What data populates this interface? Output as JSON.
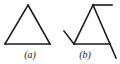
{
  "figure": {
    "background_color": "#ffffff",
    "stroke_color": "#1a1a1a",
    "stroke_width": 1.6,
    "panels": [
      {
        "id": "a",
        "label": "(a)",
        "caption_style": "italic-serif",
        "description": "closed equilateral-like triangle",
        "shape": "triangle-closed",
        "vertices": [
          {
            "name": "apex",
            "x": 28,
            "y": 5
          },
          {
            "name": "bottom-left",
            "x": 5,
            "y": 44
          },
          {
            "name": "bottom-right",
            "x": 50,
            "y": 44
          }
        ],
        "overshoots": []
      },
      {
        "id": "b",
        "label": "(b)",
        "caption_style": "italic-serif",
        "description": "triangle with each edge extending past its vertex",
        "shape": "triangle-overshoot",
        "vertices": [
          {
            "name": "apex",
            "x": 35,
            "y": 5
          },
          {
            "name": "bottom-left",
            "x": 16,
            "y": 44
          },
          {
            "name": "bottom-right",
            "x": 52,
            "y": 44
          }
        ],
        "overshoots": [
          {
            "name": "top-horizontal-right",
            "from_x": 35,
            "from_y": 5,
            "to_x": 54,
            "to_y": 5
          },
          {
            "name": "left-edge-upper-left",
            "from_x": 16,
            "from_y": 44,
            "to_x": 6,
            "to_y": 31
          },
          {
            "name": "right-edge-lower-right",
            "from_x": 52,
            "from_y": 44,
            "to_x": 58,
            "to_y": 58
          }
        ]
      }
    ]
  }
}
